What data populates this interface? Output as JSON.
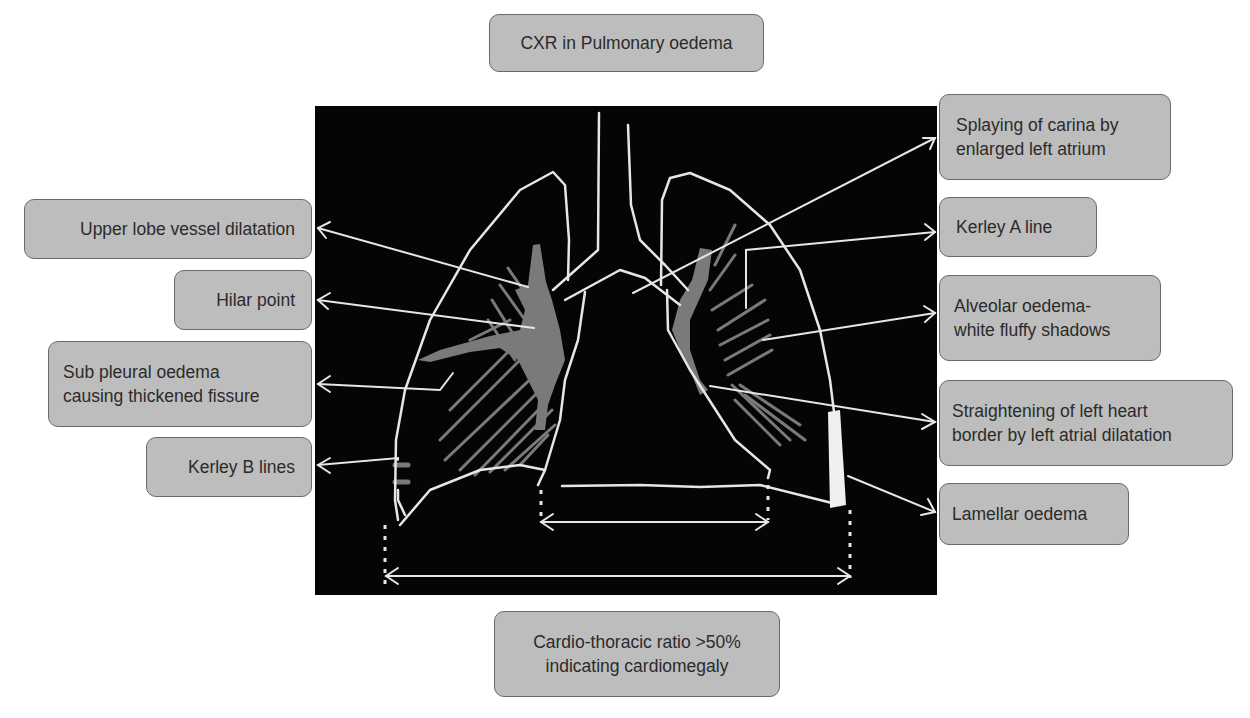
{
  "title": "CXR in Pulmonary oedema",
  "labels": {
    "upper_lobe": "Upper lobe vessel dilatation",
    "hilar": "Hilar point",
    "sub_pleural": "Sub pleural oedema\ncausing thickened fissure",
    "kerley_b": "Kerley B lines",
    "carina": "Splaying of carina by\nenlarged left atrium",
    "kerley_a": "Kerley A line",
    "alveolar": "Alveolar oedema-\nwhite fluffy shadows",
    "heart_border": "Straightening of left heart\nborder by left atrial dilatation",
    "lamellar": "Lamellar oedema",
    "ctr": "Cardio-thoracic ratio >50%\nindicating cardiomegaly"
  },
  "colors": {
    "panel": "#050505",
    "outline": "#e6e6e6",
    "vessel": "#7a7a7a",
    "box_fill": "#bdbdbd",
    "box_border": "#6a6a6a",
    "text": "#2b2b2b"
  }
}
